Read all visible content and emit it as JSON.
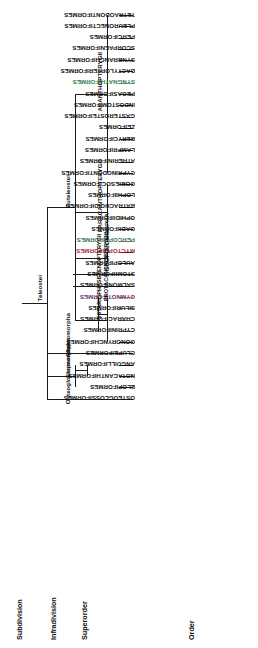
{
  "figure": {
    "type": "cladogram",
    "orientation": "rotated-180"
  },
  "column_headers": [
    {
      "id": "subdivision",
      "label": "Subdivision"
    },
    {
      "id": "infradivision",
      "label": "Infradivision"
    },
    {
      "id": "superorder",
      "label": "Superorder"
    },
    {
      "id": "order",
      "label": "Order"
    }
  ],
  "subdivision": [
    {
      "label": "Teleostei"
    }
  ],
  "infradivision": [
    {
      "label": "Euteleostei"
    },
    {
      "label": "Clupeomorpha"
    },
    {
      "label": "Elopomorpha"
    },
    {
      "label": "Osteoglossomorpha"
    }
  ],
  "superorder": [
    {
      "label": "ACANTHOPTERYGII"
    },
    {
      "label": "PARACANTHOPTERYGII"
    },
    {
      "label": "SCOPELOMORPHA"
    },
    {
      "label": "STENOPTERYGII"
    },
    {
      "label": "PROTACANTHOPTERYGII"
    },
    {
      "label": "OSTARIOPHYSI"
    }
  ],
  "orders": [
    {
      "label": "TETRAODONTIFORMES",
      "text_color": "#111111",
      "branch_color": "#1a1a1a"
    },
    {
      "label": "PLEURONECTIFORMES",
      "text_color": "#111111",
      "branch_color": "#1a1a1a"
    },
    {
      "label": "PERCIFORMES",
      "text_color": "#111111",
      "branch_color": "#1a1a1a"
    },
    {
      "label": "SCORPAENIFORMES",
      "text_color": "#111111",
      "branch_color": "#1a1a1a"
    },
    {
      "label": "SYNBRANCHIFORMES",
      "text_color": "#111111",
      "branch_color": "#1a1a1a"
    },
    {
      "label": "DACTYLOPTERIFORMES",
      "text_color": "#111111",
      "branch_color": "#1a1a1a"
    },
    {
      "label": "SYNGNATHIFORMES",
      "text_color": "#2f7d4f",
      "branch_color": "#9a9a9a"
    },
    {
      "label": "PEGASIFORMES",
      "text_color": "#111111",
      "branch_color": "#1a1a1a"
    },
    {
      "label": "INDOSTOMIFORMES",
      "text_color": "#111111",
      "branch_color": "#1a1a1a"
    },
    {
      "label": "GASTEROSTEIFORMES",
      "text_color": "#111111",
      "branch_color": "#3b3bbf"
    },
    {
      "label": "ZEIFORMES",
      "text_color": "#111111",
      "branch_color": "#1a1a1a"
    },
    {
      "label": "BERYCIFORMES",
      "text_color": "#111111",
      "branch_color": "#1a1a1a"
    },
    {
      "label": "LAMPRIFORMES",
      "text_color": "#111111",
      "branch_color": "#1a1a1a"
    },
    {
      "label": "ATHERINIFORMES",
      "text_color": "#111111",
      "branch_color": "#1a1a1a"
    },
    {
      "label": "CYPRINODONTIFORMES",
      "text_color": "#111111",
      "branch_color": "#1a1a1a"
    },
    {
      "label": "GOBIESOCIFORMES",
      "text_color": "#111111",
      "branch_color": "#1a1a1a"
    },
    {
      "label": "LOPHIIFORMES",
      "text_color": "#111111",
      "branch_color": "#1a1a1a"
    },
    {
      "label": "BATRACHOIDIFORMES",
      "text_color": "#111111",
      "branch_color": "#1a1a1a"
    },
    {
      "label": "OPHIDIIFORMES",
      "text_color": "#111111",
      "branch_color": "#e08a3c"
    },
    {
      "label": "GADIIFORMES",
      "text_color": "#111111",
      "branch_color": "#1a1a1a"
    },
    {
      "label": "PERCOPSIFORMES",
      "text_color": "#2f7d4f",
      "branch_color": "#e05a6b"
    },
    {
      "label": "MYCTOPHIFORMES",
      "text_color": "#b02a3a",
      "branch_color": "#1a1a1a"
    },
    {
      "label": "AULOPIFORMES",
      "text_color": "#111111",
      "branch_color": "#1a1a1a"
    },
    {
      "label": "STOMIIFORMES",
      "text_color": "#111111",
      "branch_color": "#1a1a1a"
    },
    {
      "label": "SALMONIFORMES",
      "text_color": "#111111",
      "branch_color": "#1a1a1a"
    },
    {
      "label": "GYMNOTIFORMES",
      "text_color": "#6b2f6b",
      "branch_color": "#e08a3c"
    },
    {
      "label": "SILURIFORMES",
      "text_color": "#111111",
      "branch_color": "#4a7a4a"
    },
    {
      "label": "CHARACIFORMES",
      "text_color": "#111111",
      "branch_color": "#4a7a4a"
    },
    {
      "label": "CYPRINIFORMES",
      "text_color": "#111111",
      "branch_color": "#4a7a4a"
    },
    {
      "label": "GONORYNCHIFORMES",
      "text_color": "#111111",
      "branch_color": "#1a1a1a"
    },
    {
      "label": "CLUPEIFORMES",
      "text_color": "#111111",
      "branch_color": "#1a1a1a"
    },
    {
      "label": "ANGUILLIFORMES",
      "text_color": "#111111",
      "branch_color": "#1a1a1a"
    },
    {
      "label": "NOTACANTHIFORMES",
      "text_color": "#111111",
      "branch_color": "#1a1a1a"
    },
    {
      "label": "ELOPIFORMES",
      "text_color": "#111111",
      "branch_color": "#1a1a1a"
    },
    {
      "label": "OSTEOGLOSSIFORMES",
      "text_color": "#111111",
      "branch_color": "#1a1a1a"
    }
  ]
}
